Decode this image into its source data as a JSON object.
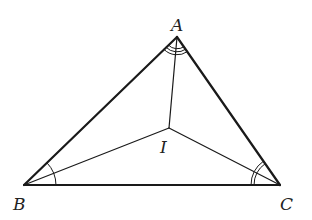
{
  "diagram": {
    "points": {
      "A": {
        "x": 177,
        "y": 37,
        "label": "A"
      },
      "B": {
        "x": 24,
        "y": 185,
        "label": "B"
      },
      "C": {
        "x": 280,
        "y": 185,
        "label": "C"
      },
      "I": {
        "x": 169,
        "y": 128,
        "label": "I"
      }
    },
    "labels": {
      "A": "A",
      "B": "B",
      "C": "C",
      "I": "I"
    },
    "angle_marks": {
      "A": {
        "arcs": 3
      },
      "B": {
        "arcs": 1
      },
      "C": {
        "arcs": 2
      }
    },
    "colors": {
      "stroke": "#1a1a1a",
      "label": "#222222"
    }
  }
}
